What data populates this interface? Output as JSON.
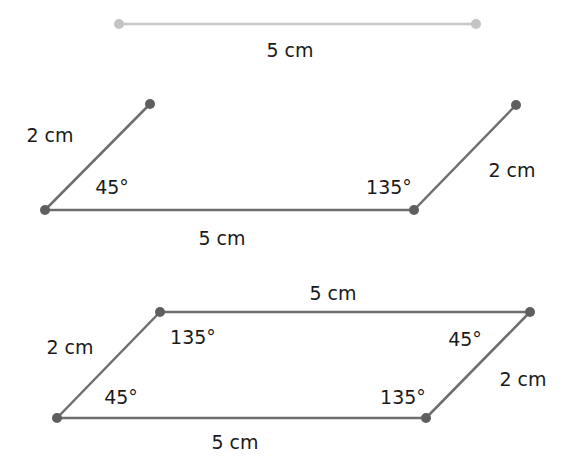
{
  "colors": {
    "step1_line": "#c8c8c8",
    "step1_point": "#c4c4c4",
    "line": "#6e6e6e",
    "point": "#5f5f5f",
    "text": "#1a1a1a"
  },
  "step1": {
    "base_label": "5 cm"
  },
  "step2": {
    "left_side_label": "2 cm",
    "right_side_label": "2 cm",
    "left_angle_label": "45°",
    "right_angle_label": "135°",
    "base_label": "5 cm"
  },
  "step3": {
    "top_label": "5 cm",
    "bottom_label": "5 cm",
    "left_side_label": "2 cm",
    "right_side_label": "2 cm",
    "top_left_angle_label": "135°",
    "top_right_angle_label": "45°",
    "bottom_left_angle_label": "45°",
    "bottom_right_angle_label": "135°"
  }
}
